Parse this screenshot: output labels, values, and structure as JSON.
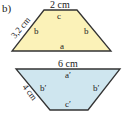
{
  "part_label": "b)",
  "upper_trapezoid": {
    "fill": "#fbf2b8",
    "stroke": "#333333",
    "top_length": "2 cm",
    "side_length": "3,2 cm",
    "labels": {
      "top": "c",
      "left": "b",
      "right": "b",
      "bottom": "a"
    }
  },
  "lower_trapezoid": {
    "fill": "#cfe6ef",
    "stroke": "#333333",
    "top_length": "6 cm",
    "side_length": "4 cm",
    "labels": {
      "top": "a′",
      "left": "b′",
      "right": "b′",
      "bottom": "c′"
    }
  }
}
